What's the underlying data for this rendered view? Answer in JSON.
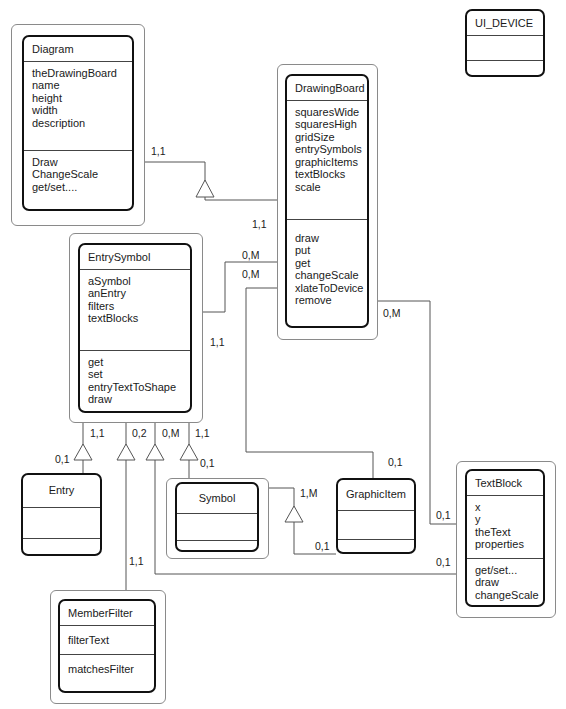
{
  "classes": {
    "diagram": {
      "name": "Diagram",
      "attributes": [
        "theDrawingBoard",
        "name",
        "height",
        "width",
        "description"
      ],
      "methods": [
        "Draw",
        "ChangeScale",
        "get/set...."
      ]
    },
    "ui_device": {
      "name": "UI_DEVICE"
    },
    "drawing_board": {
      "name": "DrawingBoard",
      "attributes": [
        "squaresWide",
        "squaresHigh",
        "gridSize",
        "entrySymbols",
        "graphicItems",
        "textBlocks",
        "scale"
      ],
      "methods": [
        "draw",
        "put",
        "get",
        "changeScale",
        "xlateToDevice",
        "remove"
      ]
    },
    "entry_symbol": {
      "name": "EntrySymbol",
      "attributes": [
        "aSymbol",
        "anEntry",
        "filters",
        "textBlocks"
      ],
      "methods": [
        "get",
        "set",
        "entryTextToShape",
        "draw"
      ]
    },
    "entry": {
      "name": "Entry"
    },
    "symbol": {
      "name": "Symbol"
    },
    "graphic_item": {
      "name": "GraphicItem"
    },
    "text_block": {
      "name": "TextBlock",
      "attributes": [
        "x",
        "y",
        "theText",
        "properties"
      ],
      "methods": [
        "get/set...",
        "draw",
        "changeScale"
      ]
    },
    "member_filter": {
      "name": "MemberFilter",
      "attributes": [
        "filterText"
      ],
      "methods": [
        "matchesFilter"
      ]
    }
  },
  "multiplicities": {
    "diagram_to_board": "1,1",
    "board_from_diagram": "1,1",
    "board_entrysymbols": "0,M",
    "board_graphicitems": "0,M",
    "board_textblocks": "0,M",
    "entrysymbol_to_board": "1,1",
    "es_entry_top": "1,1",
    "es_entry_bottom": "0,1",
    "es_filter_top": "0,2",
    "es_filter_bottom": "1,1",
    "es_textblock_top": "0,M",
    "es_symbol_top": "1,1",
    "es_symbol_bottom": "0,1",
    "graphicitem_from_board": "0,1",
    "symbol_graphicitem_top": "1,M",
    "symbol_graphicitem_bottom": "0,1",
    "textblock_from_board": "0,1",
    "textblock_from_es": "0,1"
  }
}
